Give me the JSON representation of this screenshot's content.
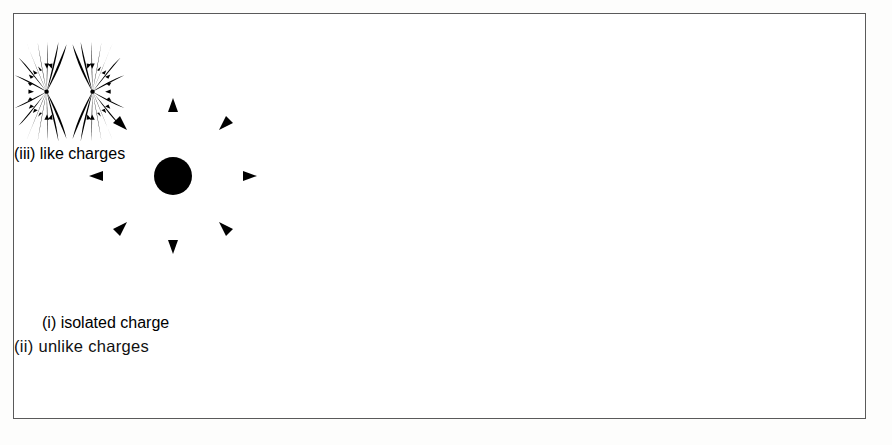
{
  "figure": {
    "panels": [
      {
        "id": "isolated",
        "caption": "(i) isolated charge",
        "charges": [
          {
            "sign": "+",
            "label": "+",
            "style": "circled",
            "x": 0,
            "y": 0
          }
        ],
        "ray_count": 8,
        "arrow_directions": [
          "outward-up",
          "inward-upper-right",
          "outward-right",
          "inward-lower-right",
          "outward-down",
          "inward-lower-left",
          "outward-left",
          "inward-upper-left"
        ]
      },
      {
        "id": "unlike",
        "caption": "(ii) unlike charges",
        "charges": [
          {
            "sign": "+",
            "label": "+",
            "style": "node",
            "x": -60,
            "y": 0
          },
          {
            "sign": "-",
            "label": "−",
            "style": "node",
            "x": 60,
            "y": 0
          }
        ],
        "arc_pairs": 4,
        "arrow_direction": "left-to-right",
        "description": "dipole field lines arcing from positive to negative charge"
      },
      {
        "id": "like",
        "caption": "(iii) like charges",
        "charges": [
          {
            "sign": "+",
            "label": "+",
            "style": "node",
            "x": -62,
            "y": 0
          },
          {
            "sign": "+",
            "label": "+",
            "style": "node",
            "x": 62,
            "y": 0
          }
        ],
        "ray_count_per_charge": 13,
        "arrow_direction": "inward-toward-each-charge",
        "description": "like charges repel, field lines curve away from the midpoint"
      }
    ]
  },
  "colors": {
    "ink": "#0d0d0d",
    "border": "#5a5a5a",
    "page": "#fdfdfc",
    "panel": "#ffffff"
  }
}
